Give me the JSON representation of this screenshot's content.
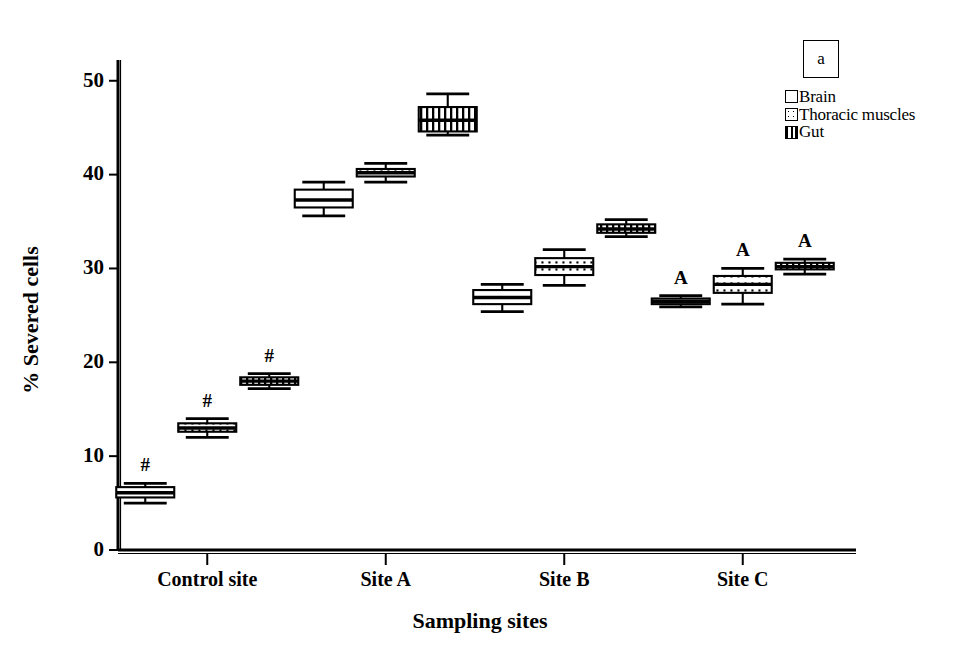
{
  "panel": {
    "tag": "a"
  },
  "legend": {
    "items": [
      {
        "label": "Brain",
        "pattern": "blank"
      },
      {
        "label": "Thoracic muscles",
        "pattern": "dots"
      },
      {
        "label": "Gut",
        "pattern": "vertical-stripes"
      }
    ]
  },
  "chart_data": {
    "type": "box",
    "title": "",
    "xlabel": "Sampling sites",
    "ylabel": "% Severed cells",
    "categories": [
      "Control site",
      "Site A",
      "Site B",
      "Site C"
    ],
    "ylim": [
      0,
      52
    ],
    "yticks": [
      0,
      10,
      20,
      30,
      40,
      50
    ],
    "grid": false,
    "legend_position": "top-right",
    "series": [
      {
        "name": "Brain",
        "pattern": "blank",
        "boxes": [
          {
            "category": "Control site",
            "whisker_low": 5.0,
            "q1": 5.6,
            "median": 6.1,
            "q3": 6.7,
            "whisker_high": 7.1,
            "annotation": "#"
          },
          {
            "category": "Site A",
            "whisker_low": 35.6,
            "q1": 36.5,
            "median": 37.3,
            "q3": 38.4,
            "whisker_high": 39.2,
            "annotation": ""
          },
          {
            "category": "Site B",
            "whisker_low": 25.4,
            "q1": 26.2,
            "median": 26.9,
            "q3": 27.7,
            "whisker_high": 28.3,
            "annotation": ""
          },
          {
            "category": "Site C",
            "whisker_low": 25.9,
            "q1": 26.2,
            "median": 26.5,
            "q3": 26.8,
            "whisker_high": 27.1,
            "annotation": "A"
          }
        ]
      },
      {
        "name": "Thoracic muscles",
        "pattern": "dots",
        "boxes": [
          {
            "category": "Control site",
            "whisker_low": 12.0,
            "q1": 12.6,
            "median": 13.0,
            "q3": 13.5,
            "whisker_high": 14.0,
            "annotation": "#"
          },
          {
            "category": "Site A",
            "whisker_low": 39.2,
            "q1": 39.8,
            "median": 40.2,
            "q3": 40.6,
            "whisker_high": 41.2,
            "annotation": ""
          },
          {
            "category": "Site B",
            "whisker_low": 28.2,
            "q1": 29.3,
            "median": 30.2,
            "q3": 31.1,
            "whisker_high": 32.0,
            "annotation": ""
          },
          {
            "category": "Site C",
            "whisker_low": 26.2,
            "q1": 27.4,
            "median": 28.3,
            "q3": 29.2,
            "whisker_high": 30.0,
            "annotation": "A"
          }
        ]
      },
      {
        "name": "Gut",
        "pattern": "vertical-stripes",
        "boxes": [
          {
            "category": "Control site",
            "whisker_low": 17.2,
            "q1": 17.6,
            "median": 18.0,
            "q3": 18.4,
            "whisker_high": 18.8,
            "annotation": "#"
          },
          {
            "category": "Site A",
            "whisker_low": 44.2,
            "q1": 44.6,
            "median": 45.8,
            "q3": 47.2,
            "whisker_high": 48.6,
            "annotation": ""
          },
          {
            "category": "Site B",
            "whisker_low": 33.4,
            "q1": 33.8,
            "median": 34.2,
            "q3": 34.7,
            "whisker_high": 35.2,
            "annotation": ""
          },
          {
            "category": "Site C",
            "whisker_low": 29.4,
            "q1": 29.9,
            "median": 30.2,
            "q3": 30.6,
            "whisker_high": 31.0,
            "annotation": "A"
          }
        ]
      }
    ]
  }
}
